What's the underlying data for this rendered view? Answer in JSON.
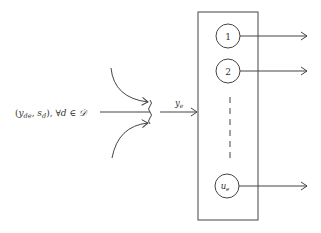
{
  "diagram": {
    "input_label": {
      "open": "(",
      "y": "y",
      "y_sub": "de",
      "comma": ", ",
      "s": "s",
      "s_sub": "d",
      "close": "), ",
      "forall": "∀",
      "d": "d",
      "in": " ∈ ",
      "set": "𝒟"
    },
    "aggregate_label": {
      "y": "y",
      "sub": "e"
    },
    "nodes": [
      {
        "label": "1",
        "sub": ""
      },
      {
        "label": "2",
        "sub": ""
      },
      {
        "label": "u",
        "sub": "e"
      }
    ],
    "colors": {
      "stroke": "#444444",
      "text": "#333333",
      "background": "#ffffff"
    }
  }
}
